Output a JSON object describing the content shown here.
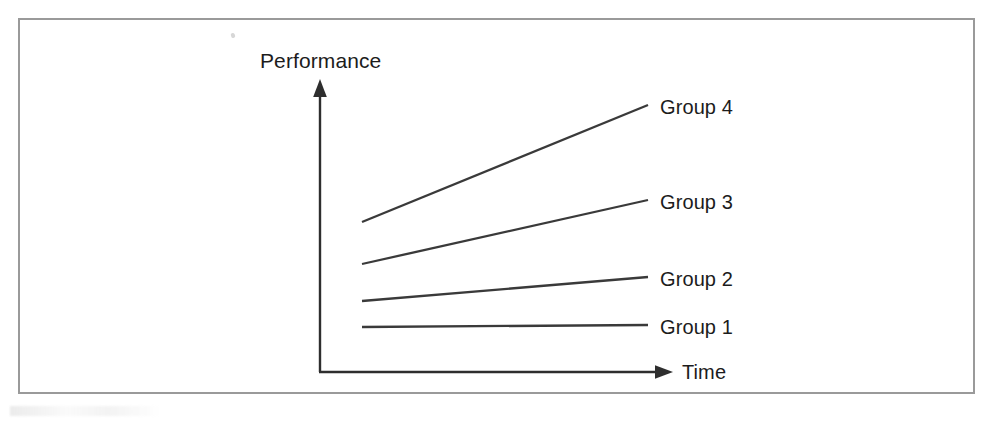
{
  "figure": {
    "frame": {
      "border_color": "#9a9a9a",
      "background_color": "#ffffff"
    },
    "axes": {
      "y_axis_label": "Performance",
      "x_axis_label": "Time",
      "axis_color": "#2e2e2e"
    },
    "line_color": "#3a3a3a"
  },
  "chart_data": {
    "type": "line",
    "title": "",
    "subtitle": "",
    "xlabel": "Time",
    "ylabel": "Performance",
    "xlim": [
      0,
      1
    ],
    "ylim": [
      0,
      1
    ],
    "grid": false,
    "axis_ticks": false,
    "tick_labels": {
      "x": [],
      "y": []
    },
    "legend": "inline-right-of-line-ends",
    "x": [
      0,
      1
    ],
    "annotations": [],
    "series": [
      {
        "name": "Group 4",
        "label": "Group 4",
        "values": [
          0.51,
          0.91
        ],
        "slope": "steep-increase",
        "px_start": {
          "x": 362,
          "y": 222
        },
        "px_end": {
          "x": 648,
          "y": 105
        },
        "label_px": {
          "x": 660,
          "y": 97
        }
      },
      {
        "name": "Group 3",
        "label": "Group 3",
        "values": [
          0.37,
          0.59
        ],
        "slope": "moderate-increase",
        "px_start": {
          "x": 362,
          "y": 264
        },
        "px_end": {
          "x": 648,
          "y": 200
        },
        "label_px": {
          "x": 660,
          "y": 192
        }
      },
      {
        "name": "Group 2",
        "label": "Group 2",
        "values": [
          0.24,
          0.33
        ],
        "slope": "slight-increase",
        "px_start": {
          "x": 362,
          "y": 301
        },
        "px_end": {
          "x": 648,
          "y": 277
        },
        "label_px": {
          "x": 660,
          "y": 269
        }
      },
      {
        "name": "Group 1",
        "label": "Group 1",
        "values": [
          0.15,
          0.16
        ],
        "slope": "flat",
        "px_start": {
          "x": 362,
          "y": 327
        },
        "px_end": {
          "x": 648,
          "y": 325
        },
        "label_px": {
          "x": 660,
          "y": 317
        }
      }
    ]
  }
}
